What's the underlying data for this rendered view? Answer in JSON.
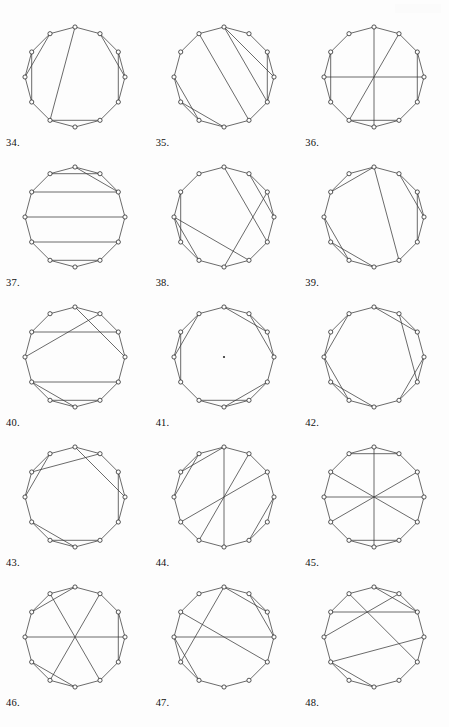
{
  "page": {
    "background_color": "#fdfdfd",
    "line_color": "#3a3a3a",
    "vertex_fill": "#ffffff",
    "vertex_stroke": "#2b2b2b",
    "vertex_count": 12,
    "columns": 3,
    "rows": 5
  },
  "figures": [
    {
      "label": "34.",
      "number": 34,
      "vertices": 12,
      "center_dot": false,
      "chords": [
        [
          0,
          1
        ],
        [
          1,
          2
        ],
        [
          2,
          3
        ],
        [
          3,
          4
        ],
        [
          4,
          5
        ],
        [
          5,
          6
        ],
        [
          6,
          7
        ],
        [
          7,
          8
        ],
        [
          8,
          9
        ],
        [
          9,
          10
        ],
        [
          10,
          11
        ],
        [
          11,
          0
        ],
        [
          0,
          7
        ],
        [
          1,
          3
        ],
        [
          2,
          4
        ],
        [
          5,
          7
        ],
        [
          8,
          10
        ],
        [
          9,
          11
        ]
      ]
    },
    {
      "label": "35.",
      "number": 35,
      "vertices": 12,
      "center_dot": false,
      "chords": [
        [
          0,
          1
        ],
        [
          1,
          2
        ],
        [
          2,
          3
        ],
        [
          3,
          4
        ],
        [
          4,
          5
        ],
        [
          5,
          6
        ],
        [
          6,
          7
        ],
        [
          7,
          8
        ],
        [
          8,
          9
        ],
        [
          9,
          10
        ],
        [
          10,
          11
        ],
        [
          11,
          0
        ],
        [
          0,
          3
        ],
        [
          0,
          4
        ],
        [
          2,
          4
        ],
        [
          5,
          11
        ],
        [
          6,
          8
        ],
        [
          7,
          9
        ]
      ]
    },
    {
      "label": "36.",
      "number": 36,
      "vertices": 12,
      "center_dot": false,
      "chords": [
        [
          0,
          1
        ],
        [
          1,
          2
        ],
        [
          2,
          3
        ],
        [
          3,
          4
        ],
        [
          4,
          5
        ],
        [
          5,
          6
        ],
        [
          6,
          7
        ],
        [
          7,
          8
        ],
        [
          8,
          9
        ],
        [
          9,
          10
        ],
        [
          10,
          11
        ],
        [
          11,
          0
        ],
        [
          0,
          6
        ],
        [
          1,
          7
        ],
        [
          2,
          4
        ],
        [
          3,
          9
        ],
        [
          5,
          7
        ],
        [
          8,
          10
        ]
      ]
    },
    {
      "label": "37.",
      "number": 37,
      "vertices": 12,
      "center_dot": false,
      "chords": [
        [
          0,
          1
        ],
        [
          1,
          2
        ],
        [
          2,
          3
        ],
        [
          3,
          4
        ],
        [
          4,
          5
        ],
        [
          5,
          6
        ],
        [
          6,
          7
        ],
        [
          7,
          8
        ],
        [
          8,
          9
        ],
        [
          9,
          10
        ],
        [
          10,
          11
        ],
        [
          11,
          0
        ],
        [
          1,
          11
        ],
        [
          2,
          10
        ],
        [
          3,
          9
        ],
        [
          4,
          8
        ],
        [
          5,
          7
        ],
        [
          0,
          2
        ]
      ]
    },
    {
      "label": "38.",
      "number": 38,
      "vertices": 12,
      "center_dot": false,
      "chords": [
        [
          0,
          1
        ],
        [
          1,
          2
        ],
        [
          2,
          3
        ],
        [
          3,
          4
        ],
        [
          4,
          5
        ],
        [
          5,
          6
        ],
        [
          6,
          7
        ],
        [
          7,
          8
        ],
        [
          8,
          9
        ],
        [
          9,
          10
        ],
        [
          10,
          11
        ],
        [
          11,
          0
        ],
        [
          0,
          4
        ],
        [
          1,
          3
        ],
        [
          2,
          6
        ],
        [
          5,
          9
        ],
        [
          7,
          9
        ],
        [
          8,
          10
        ]
      ]
    },
    {
      "label": "39.",
      "number": 39,
      "vertices": 12,
      "center_dot": false,
      "chords": [
        [
          0,
          1
        ],
        [
          1,
          2
        ],
        [
          2,
          3
        ],
        [
          3,
          4
        ],
        [
          4,
          5
        ],
        [
          5,
          6
        ],
        [
          6,
          7
        ],
        [
          7,
          8
        ],
        [
          8,
          9
        ],
        [
          9,
          10
        ],
        [
          10,
          11
        ],
        [
          11,
          0
        ],
        [
          0,
          5
        ],
        [
          1,
          3
        ],
        [
          2,
          4
        ],
        [
          6,
          8
        ],
        [
          7,
          9
        ],
        [
          10,
          0
        ]
      ]
    },
    {
      "label": "40.",
      "number": 40,
      "vertices": 12,
      "center_dot": false,
      "chords": [
        [
          0,
          1
        ],
        [
          1,
          2
        ],
        [
          2,
          3
        ],
        [
          3,
          4
        ],
        [
          4,
          5
        ],
        [
          5,
          6
        ],
        [
          6,
          7
        ],
        [
          7,
          8
        ],
        [
          8,
          9
        ],
        [
          9,
          10
        ],
        [
          10,
          11
        ],
        [
          11,
          0
        ],
        [
          0,
          3
        ],
        [
          1,
          9
        ],
        [
          2,
          10
        ],
        [
          4,
          8
        ],
        [
          5,
          7
        ],
        [
          6,
          8
        ]
      ]
    },
    {
      "label": "41.",
      "number": 41,
      "vertices": 12,
      "center_dot": true,
      "chords": [
        [
          0,
          1
        ],
        [
          1,
          2
        ],
        [
          2,
          3
        ],
        [
          3,
          4
        ],
        [
          4,
          5
        ],
        [
          5,
          6
        ],
        [
          6,
          7
        ],
        [
          7,
          8
        ],
        [
          8,
          9
        ],
        [
          9,
          10
        ],
        [
          10,
          11
        ],
        [
          11,
          0
        ],
        [
          0,
          2
        ],
        [
          1,
          3
        ],
        [
          4,
          6
        ],
        [
          5,
          7
        ],
        [
          8,
          10
        ],
        [
          9,
          11
        ]
      ]
    },
    {
      "label": "42.",
      "number": 42,
      "vertices": 12,
      "center_dot": false,
      "chords": [
        [
          0,
          1
        ],
        [
          1,
          2
        ],
        [
          2,
          3
        ],
        [
          3,
          4
        ],
        [
          4,
          5
        ],
        [
          5,
          6
        ],
        [
          6,
          7
        ],
        [
          7,
          8
        ],
        [
          8,
          9
        ],
        [
          9,
          10
        ],
        [
          10,
          11
        ],
        [
          11,
          0
        ],
        [
          0,
          2
        ],
        [
          1,
          4
        ],
        [
          3,
          5
        ],
        [
          6,
          8
        ],
        [
          7,
          9
        ],
        [
          9,
          11
        ]
      ]
    },
    {
      "label": "43.",
      "number": 43,
      "vertices": 12,
      "center_dot": false,
      "chords": [
        [
          0,
          1
        ],
        [
          1,
          2
        ],
        [
          2,
          3
        ],
        [
          3,
          4
        ],
        [
          4,
          5
        ],
        [
          5,
          6
        ],
        [
          6,
          7
        ],
        [
          7,
          8
        ],
        [
          8,
          9
        ],
        [
          9,
          10
        ],
        [
          10,
          11
        ],
        [
          11,
          0
        ],
        [
          0,
          3
        ],
        [
          1,
          10
        ],
        [
          2,
          4
        ],
        [
          5,
          7
        ],
        [
          6,
          8
        ],
        [
          9,
          11
        ]
      ]
    },
    {
      "label": "44.",
      "number": 44,
      "vertices": 12,
      "center_dot": false,
      "chords": [
        [
          0,
          1
        ],
        [
          1,
          2
        ],
        [
          2,
          3
        ],
        [
          3,
          4
        ],
        [
          4,
          5
        ],
        [
          5,
          6
        ],
        [
          6,
          7
        ],
        [
          7,
          8
        ],
        [
          8,
          9
        ],
        [
          9,
          10
        ],
        [
          10,
          11
        ],
        [
          11,
          0
        ],
        [
          0,
          6
        ],
        [
          1,
          7
        ],
        [
          2,
          8
        ],
        [
          3,
          5
        ],
        [
          9,
          11
        ],
        [
          10,
          0
        ]
      ]
    },
    {
      "label": "45.",
      "number": 45,
      "vertices": 12,
      "center_dot": false,
      "chords": [
        [
          0,
          1
        ],
        [
          1,
          2
        ],
        [
          2,
          3
        ],
        [
          3,
          4
        ],
        [
          4,
          5
        ],
        [
          5,
          6
        ],
        [
          6,
          7
        ],
        [
          7,
          8
        ],
        [
          8,
          9
        ],
        [
          9,
          10
        ],
        [
          10,
          11
        ],
        [
          11,
          0
        ],
        [
          0,
          6
        ],
        [
          2,
          8
        ],
        [
          3,
          9
        ],
        [
          4,
          10
        ],
        [
          1,
          11
        ],
        [
          5,
          7
        ]
      ]
    },
    {
      "label": "46.",
      "number": 46,
      "vertices": 12,
      "center_dot": false,
      "chords": [
        [
          0,
          1
        ],
        [
          1,
          2
        ],
        [
          2,
          3
        ],
        [
          3,
          4
        ],
        [
          4,
          5
        ],
        [
          5,
          6
        ],
        [
          6,
          7
        ],
        [
          7,
          8
        ],
        [
          8,
          9
        ],
        [
          9,
          10
        ],
        [
          10,
          11
        ],
        [
          11,
          0
        ],
        [
          1,
          7
        ],
        [
          2,
          4
        ],
        [
          3,
          9
        ],
        [
          5,
          11
        ],
        [
          6,
          8
        ],
        [
          0,
          10
        ]
      ]
    },
    {
      "label": "47.",
      "number": 47,
      "vertices": 12,
      "center_dot": false,
      "chords": [
        [
          0,
          1
        ],
        [
          1,
          2
        ],
        [
          2,
          3
        ],
        [
          3,
          4
        ],
        [
          4,
          5
        ],
        [
          5,
          6
        ],
        [
          6,
          7
        ],
        [
          7,
          8
        ],
        [
          8,
          9
        ],
        [
          9,
          10
        ],
        [
          10,
          11
        ],
        [
          11,
          0
        ],
        [
          0,
          2
        ],
        [
          0,
          8
        ],
        [
          1,
          3
        ],
        [
          3,
          9
        ],
        [
          4,
          10
        ],
        [
          7,
          9
        ]
      ]
    },
    {
      "label": "48.",
      "number": 48,
      "vertices": 12,
      "center_dot": false,
      "chords": [
        [
          0,
          1
        ],
        [
          1,
          2
        ],
        [
          2,
          3
        ],
        [
          3,
          4
        ],
        [
          4,
          5
        ],
        [
          5,
          6
        ],
        [
          6,
          7
        ],
        [
          7,
          8
        ],
        [
          8,
          9
        ],
        [
          9,
          10
        ],
        [
          10,
          11
        ],
        [
          11,
          0
        ],
        [
          1,
          9
        ],
        [
          2,
          10
        ],
        [
          3,
          8
        ],
        [
          4,
          11
        ],
        [
          0,
          2
        ],
        [
          6,
          8
        ]
      ]
    }
  ]
}
